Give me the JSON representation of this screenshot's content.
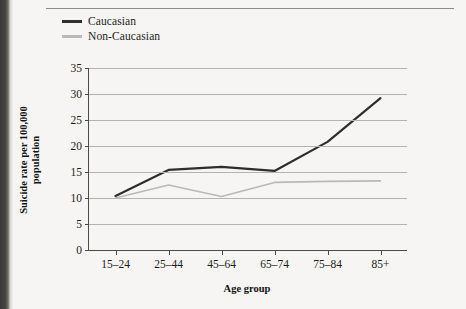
{
  "legend": {
    "position": "top-left",
    "entries": [
      {
        "label": "Caucasian",
        "color": "#2e2e2e"
      },
      {
        "label": "Non-Caucasian",
        "color": "#b9b9b9"
      }
    ]
  },
  "axes": {
    "ylabel": "Suicide rate per 100,000 population",
    "ylabel_line1": "Suicide rate per 100,000",
    "ylabel_line2": "population",
    "xlabel": "Age group"
  },
  "chart_data": {
    "type": "line",
    "title": "",
    "xlabel": "Age group",
    "ylabel": "Suicide rate per 100,000 population",
    "categories": [
      "15–24",
      "25–44",
      "45–64",
      "65–74",
      "75–84",
      "85+"
    ],
    "ylim": [
      0,
      35
    ],
    "yticks": [
      0,
      5,
      10,
      15,
      20,
      25,
      30,
      35
    ],
    "ytick_labels": [
      "0",
      "5",
      "10",
      "15",
      "20",
      "25",
      "30",
      "35"
    ],
    "grid": "horizontal",
    "legend_position": "top-left",
    "series": [
      {
        "name": "Caucasian",
        "color": "#2e2e2e",
        "values": [
          10.4,
          15.4,
          16.0,
          15.2,
          20.8,
          29.2
        ]
      },
      {
        "name": "Non-Caucasian",
        "color": "#b9b9b9",
        "values": [
          10.0,
          12.5,
          10.3,
          13.0,
          13.2,
          13.3
        ]
      }
    ]
  }
}
